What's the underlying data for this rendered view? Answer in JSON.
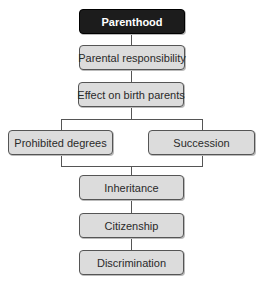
{
  "diagram": {
    "type": "flowchart",
    "colors": {
      "root_fill": "#1c1c1c",
      "node_fill": "#dcdcdc",
      "line": "#555555"
    },
    "nodes": {
      "root": "Parenthood",
      "n1": "Parental responsibility",
      "n2": "Effect on birth parents",
      "left": "Prohibited degrees",
      "right": "Succession",
      "n3": "Inheritance",
      "n4": "Citizenship",
      "n5": "Discrimination"
    }
  }
}
